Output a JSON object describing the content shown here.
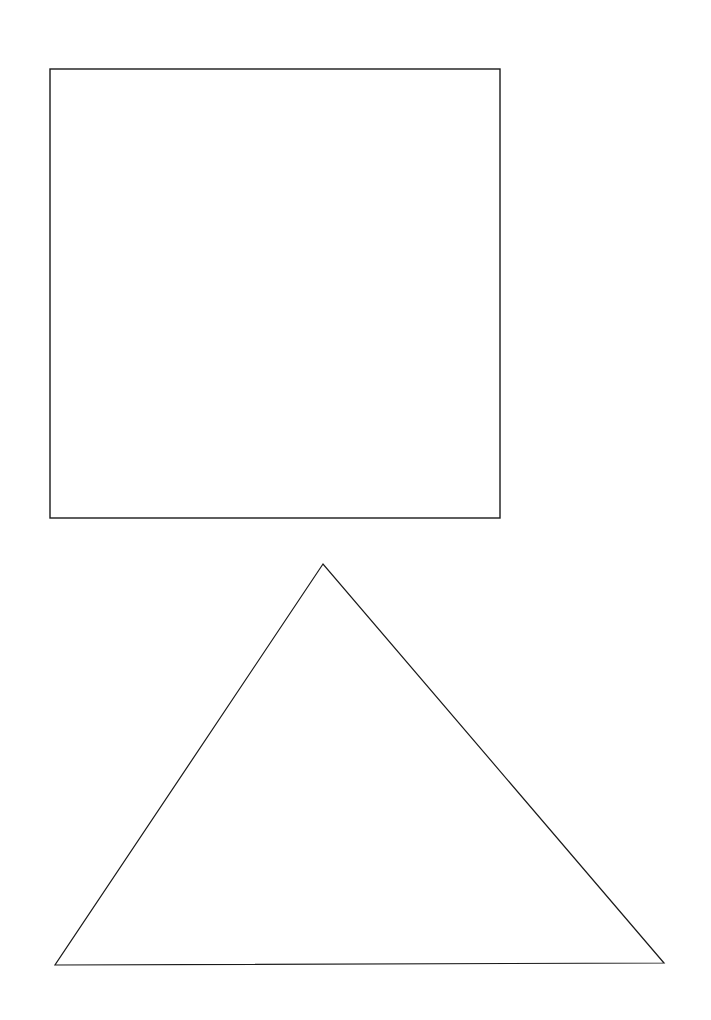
{
  "canvas": {
    "width": 711,
    "height": 1020,
    "background": "#ffffff"
  },
  "shapes": [
    {
      "type": "square",
      "x": 50,
      "y": 69,
      "width": 450,
      "height": 449,
      "stroke": "#1a1a1a",
      "stroke_width": 1.4,
      "fill": "none"
    },
    {
      "type": "triangle",
      "points": [
        [
          323,
          564
        ],
        [
          55,
          965
        ],
        [
          664,
          963
        ]
      ],
      "stroke": "#1a1a1a",
      "stroke_width": 1.2,
      "fill": "none"
    }
  ]
}
